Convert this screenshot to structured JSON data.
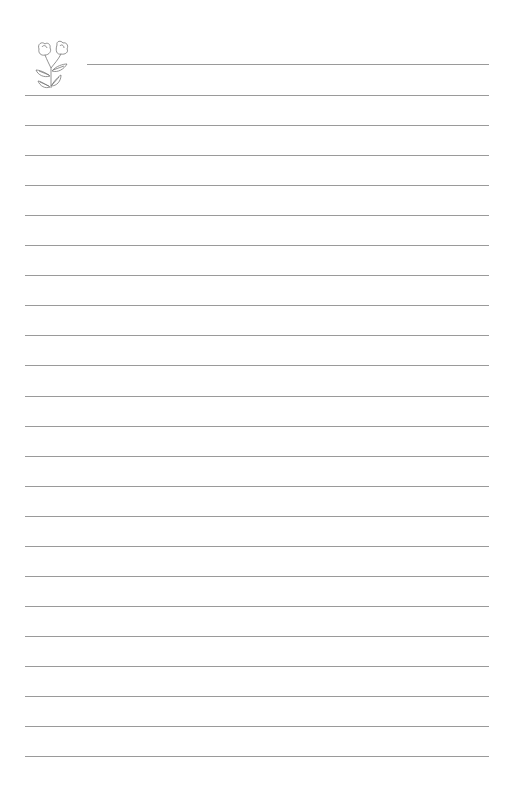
{
  "page": {
    "type": "lined-notebook-page",
    "background_color": "#ffffff",
    "line_color": "#9a9a9a",
    "header_line": {
      "x_start": 87,
      "x_end": 489,
      "y": 64
    },
    "body_lines": {
      "x_start": 25,
      "x_end": 489,
      "first_y": 95,
      "spacing": 30.05,
      "count": 23
    },
    "decoration": {
      "icon": "flower-doodle-icon",
      "description": "two-bloom flower sprig with leaves"
    }
  }
}
